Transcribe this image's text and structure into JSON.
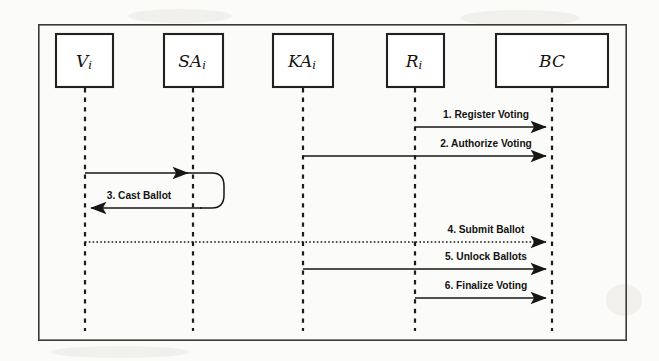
{
  "figure": {
    "type": "sequence-diagram",
    "frame": {
      "x": 38,
      "y": 24,
      "width": 589,
      "height": 317
    },
    "actors": [
      {
        "id": "voter",
        "name": "V",
        "subscript": "i",
        "box": {
          "x": 56,
          "y": 34,
          "width": 57,
          "height": 53
        },
        "lifeline_x": 85,
        "lifeline_y1": 87,
        "lifeline_y2": 331
      },
      {
        "id": "sa",
        "name": "SA",
        "subscript": "i",
        "box": {
          "x": 164,
          "y": 34,
          "width": 59,
          "height": 53
        },
        "lifeline_x": 193,
        "lifeline_y1": 87,
        "lifeline_y2": 331
      },
      {
        "id": "ka",
        "name": "KA",
        "subscript": "i",
        "box": {
          "x": 273,
          "y": 34,
          "width": 60,
          "height": 53
        },
        "lifeline_x": 303,
        "lifeline_y1": 87,
        "lifeline_y2": 331
      },
      {
        "id": "registrar",
        "name": "R",
        "subscript": "i",
        "box": {
          "x": 387,
          "y": 34,
          "width": 57,
          "height": 53
        },
        "lifeline_x": 415,
        "lifeline_y1": 87,
        "lifeline_y2": 331
      },
      {
        "id": "bc",
        "name": "BC",
        "subscript": "",
        "box": {
          "x": 496,
          "y": 34,
          "width": 112,
          "height": 53
        },
        "lifeline_x": 552,
        "lifeline_y1": 87,
        "lifeline_y2": 331
      }
    ],
    "messages": [
      {
        "number": "1",
        "label": "1. Register Voting",
        "from": "registrar",
        "to": "bc",
        "x1": 415,
        "x2": 552,
        "y": 127,
        "label_x": 486,
        "label_y": 118,
        "style": "solid",
        "kind": "straight"
      },
      {
        "number": "2",
        "label": "2. Authorize Voting",
        "from": "ka",
        "to": "bc",
        "x1": 303,
        "x2": 552,
        "y": 156,
        "label_x": 486,
        "label_y": 147,
        "style": "solid",
        "kind": "straight"
      },
      {
        "number": "3",
        "label": "3. Cast Ballot",
        "from": "voter",
        "to": "sa",
        "x1": 85,
        "x2": 193,
        "y": 173,
        "y_return": 208,
        "loop_x": 222,
        "label_x": 139,
        "label_y": 199,
        "style": "solid",
        "kind": "loop"
      },
      {
        "number": "4",
        "label": "4. Submit Ballot",
        "from": "voter",
        "to": "bc",
        "x1": 85,
        "x2": 552,
        "y": 242,
        "label_x": 486,
        "label_y": 233,
        "style": "dotted",
        "kind": "straight"
      },
      {
        "number": "5",
        "label": "5. Unlock Ballots",
        "from": "ka",
        "to": "bc",
        "x1": 303,
        "x2": 552,
        "y": 269,
        "label_x": 486,
        "label_y": 260,
        "style": "solid",
        "kind": "straight"
      },
      {
        "number": "6",
        "label": "6. Finalize Voting",
        "from": "registrar",
        "to": "bc",
        "x1": 415,
        "x2": 552,
        "y": 298,
        "label_x": 486,
        "label_y": 289,
        "style": "solid",
        "kind": "straight"
      }
    ],
    "colors": {
      "stroke": "#171615",
      "frame": "#3a3a38",
      "background": "#fbfbfa",
      "box_fill": "#ffffff"
    }
  }
}
